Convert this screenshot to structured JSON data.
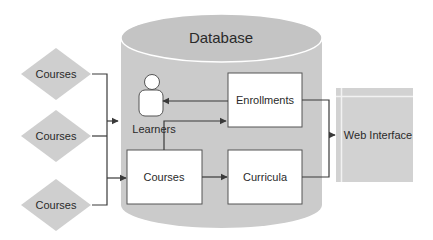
{
  "diagram": {
    "title": "Database",
    "colors": {
      "cylinder_fill": "#cbcbcb",
      "cylinder_top": "#c6c6c6",
      "diamond_fill": "#cfcfcf",
      "box_fill": "#ffffff",
      "box_stroke": "#555555",
      "line": "#3a3a3a",
      "web_fill": "#d2d2d2",
      "text": "#2a2a2a"
    },
    "sources": [
      {
        "label": "Courses"
      },
      {
        "label": "Courses"
      },
      {
        "label": "Courses"
      }
    ],
    "learners": {
      "label": "Learners",
      "icon": "person-icon"
    },
    "boxes": {
      "enrollments": "Enrollments",
      "courses": "Courses",
      "curricula": "Curricula"
    },
    "web_interface": "Web Interface",
    "edges": [
      {
        "from": "Courses (sources)",
        "to": "Learners"
      },
      {
        "from": "Courses (sources)",
        "to": "Courses"
      },
      {
        "from": "Enrollments",
        "to": "Learners"
      },
      {
        "from": "Courses",
        "to": "Enrollments"
      },
      {
        "from": "Courses",
        "to": "Curricula"
      },
      {
        "from": "Enrollments",
        "to": "Web Interface"
      },
      {
        "from": "Curricula",
        "to": "Web Interface"
      }
    ]
  }
}
